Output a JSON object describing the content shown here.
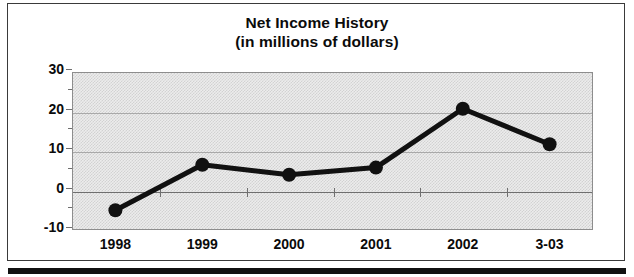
{
  "chart_data": {
    "type": "line",
    "title": "Net Income History",
    "subtitle": "(in millions of dollars)",
    "xlabel": "",
    "ylabel": "",
    "categories": [
      "1998",
      "1999",
      "2000",
      "2001",
      "2002",
      "3-03"
    ],
    "values": [
      -5,
      6.5,
      4,
      5.8,
      20.7,
      11.7
    ],
    "ylim": [
      -10,
      30
    ],
    "ytick_labels": [
      "30",
      "20",
      "10",
      "0",
      "-10"
    ],
    "ytick_values": [
      30,
      20,
      10,
      0,
      -10
    ],
    "yminor_values": [
      25,
      15,
      5,
      -5
    ],
    "grid": true,
    "legend": null,
    "series": [
      {
        "name": "Net Income",
        "values": [
          -5,
          6.5,
          4,
          5.8,
          20.7,
          11.7
        ],
        "line_color": "#111111",
        "marker": "circle",
        "marker_color": "#111111"
      }
    ],
    "colors": {
      "line": "#111111",
      "marker": "#111111",
      "plot_background": "#ececec",
      "grid": "#a9a9a9",
      "axis": "#6f6f6f",
      "text": "#0b0b0b",
      "frame": "#3a3a3a"
    }
  }
}
